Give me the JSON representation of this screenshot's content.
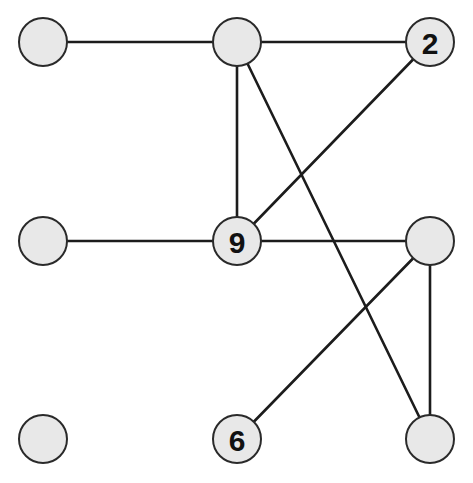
{
  "diagram": {
    "type": "grid-graph-puzzle",
    "colors": {
      "background": "#ffffff",
      "node_fill": "#e8e8e8",
      "node_stroke": "#2a2a2a",
      "edge": "#1c1c1c",
      "label": "#111111"
    },
    "node_radius": 24,
    "nodes": [
      {
        "id": "r0c0",
        "row": 0,
        "col": 0,
        "x": 43,
        "y": 42,
        "label": ""
      },
      {
        "id": "r0c1",
        "row": 0,
        "col": 1,
        "x": 237,
        "y": 42,
        "label": ""
      },
      {
        "id": "r0c2",
        "row": 0,
        "col": 2,
        "x": 430,
        "y": 42,
        "label": "2"
      },
      {
        "id": "r1c0",
        "row": 1,
        "col": 0,
        "x": 43,
        "y": 241,
        "label": ""
      },
      {
        "id": "r1c1",
        "row": 1,
        "col": 1,
        "x": 237,
        "y": 241,
        "label": "9"
      },
      {
        "id": "r1c2",
        "row": 1,
        "col": 2,
        "x": 430,
        "y": 241,
        "label": ""
      },
      {
        "id": "r2c0",
        "row": 2,
        "col": 0,
        "x": 43,
        "y": 439,
        "label": ""
      },
      {
        "id": "r2c1",
        "row": 2,
        "col": 1,
        "x": 237,
        "y": 439,
        "label": "6"
      },
      {
        "id": "r2c2",
        "row": 2,
        "col": 2,
        "x": 430,
        "y": 439,
        "label": ""
      }
    ],
    "edges": [
      {
        "from": "r0c0",
        "to": "r0c1"
      },
      {
        "from": "r0c1",
        "to": "r0c2"
      },
      {
        "from": "r0c1",
        "to": "r1c1"
      },
      {
        "from": "r0c1",
        "to": "r2c2"
      },
      {
        "from": "r0c2",
        "to": "r1c1"
      },
      {
        "from": "r1c0",
        "to": "r1c1"
      },
      {
        "from": "r1c1",
        "to": "r1c2"
      },
      {
        "from": "r1c2",
        "to": "r2c1"
      },
      {
        "from": "r1c2",
        "to": "r2c2"
      }
    ]
  }
}
